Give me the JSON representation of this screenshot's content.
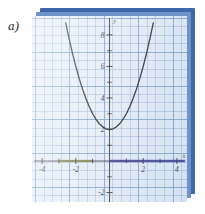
{
  "figure": {
    "part_label": "a)",
    "paper_color": "#e3ecf7",
    "stack_back_color": "#3f68ab",
    "stack_mid_color": "#6f93c9",
    "grid_line_color": "#96b4d7",
    "curve_color": "#2b2b33"
  },
  "chart_data": {
    "type": "line",
    "title": "",
    "xlabel": "x",
    "ylabel": "y",
    "xlim": [
      -4.6,
      4.6
    ],
    "ylim": [
      -2.6,
      9.2
    ],
    "grid": true,
    "legend": "none",
    "x_ticks": [
      -4,
      -2,
      2,
      4
    ],
    "x_tick_labels": [
      "-4",
      "-2",
      "2",
      "4"
    ],
    "y_ticks": [
      -2,
      2,
      4,
      6,
      8
    ],
    "y_tick_labels": [
      "-2",
      "2",
      "4",
      "6",
      "8"
    ],
    "series": [
      {
        "name": "parabola",
        "equation": "y = x^2 + 2",
        "color": "#2b2b33",
        "x": [
          -2.6,
          -2.4,
          -2.2,
          -2.0,
          -1.8,
          -1.6,
          -1.4,
          -1.2,
          -1.0,
          -0.8,
          -0.6,
          -0.4,
          -0.2,
          0.0,
          0.2,
          0.4,
          0.6,
          0.8,
          1.0,
          1.2,
          1.4,
          1.6,
          1.8,
          2.0,
          2.2,
          2.4,
          2.6
        ],
        "y": [
          8.76,
          7.76,
          6.84,
          6.0,
          5.24,
          4.56,
          3.96,
          3.44,
          3.0,
          2.64,
          2.36,
          2.16,
          2.04,
          2.0,
          2.04,
          2.16,
          2.36,
          2.64,
          3.0,
          3.44,
          3.96,
          4.56,
          5.24,
          6.0,
          6.84,
          7.76,
          8.76
        ]
      }
    ],
    "annotations": [
      {
        "name": "x-axis-highlight-olive",
        "type": "segment",
        "axis": "x",
        "from": -3.0,
        "to": -1.0,
        "color": "#b9bb4a"
      },
      {
        "name": "x-axis-highlight-blue",
        "type": "segment",
        "axis": "x",
        "from": 0.0,
        "to": 4.5,
        "color": "#3a3ad0"
      }
    ]
  }
}
